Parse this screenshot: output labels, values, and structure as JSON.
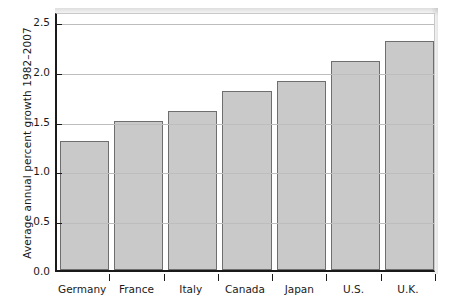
{
  "chart_data": {
    "type": "bar",
    "title": "",
    "subtitle": "",
    "xlabel": "",
    "ylabel": "Average annual percent growth 1982–2007",
    "categories": [
      "Germany",
      "France",
      "Italy",
      "Canada",
      "Japan",
      "U.S.",
      "U.K."
    ],
    "values": [
      1.3,
      1.5,
      1.6,
      1.8,
      1.9,
      2.1,
      2.3
    ],
    "series": [
      {
        "name": "Average annual percent growth 1982–2007",
        "values": [
          1.3,
          1.5,
          1.6,
          1.8,
          1.9,
          2.1,
          2.3
        ]
      }
    ],
    "ylim": [
      0.0,
      2.6
    ],
    "yticks": [
      0.0,
      0.5,
      1.0,
      1.5,
      2.0,
      2.5
    ],
    "ytick_labels": [
      "0.0",
      "0.5",
      "1.0",
      "1.5",
      "2.0",
      "2.5"
    ],
    "grid": true,
    "grid_axis": "y",
    "legend": false,
    "legend_position": "none",
    "bar_fill_color": "#c9c9c9",
    "bar_edge_color": "#6e6e6e",
    "gridline_color": "#bdbdbd",
    "axis_color": "#1a1a1a",
    "background_color": "#ffffff"
  },
  "axes": {
    "y_title": "Average annual percent growth 1982–2007"
  }
}
